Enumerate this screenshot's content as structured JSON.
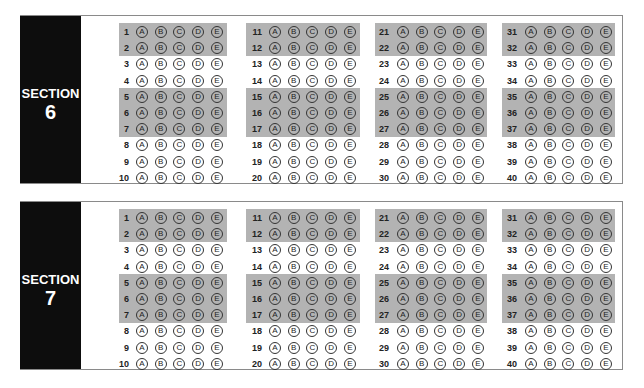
{
  "choices": [
    "A",
    "B",
    "C",
    "D",
    "E"
  ],
  "sections": [
    {
      "label": "SECTION",
      "number": "6",
      "columns": [
        {
          "questions": [
            "1",
            "2",
            "3",
            "4",
            "5",
            "6",
            "7",
            "8",
            "9",
            "10"
          ]
        },
        {
          "questions": [
            "11",
            "12",
            "13",
            "14",
            "15",
            "16",
            "17",
            "18",
            "19",
            "20"
          ]
        },
        {
          "questions": [
            "21",
            "22",
            "23",
            "24",
            "25",
            "26",
            "27",
            "28",
            "29",
            "30"
          ]
        },
        {
          "questions": [
            "31",
            "32",
            "33",
            "34",
            "35",
            "36",
            "37",
            "38",
            "39",
            "40"
          ]
        }
      ]
    },
    {
      "label": "SECTION",
      "number": "7",
      "columns": [
        {
          "questions": [
            "1",
            "2",
            "3",
            "4",
            "5",
            "6",
            "7",
            "8",
            "9",
            "10"
          ]
        },
        {
          "questions": [
            "11",
            "12",
            "13",
            "14",
            "15",
            "16",
            "17",
            "18",
            "19",
            "20"
          ]
        },
        {
          "questions": [
            "21",
            "22",
            "23",
            "24",
            "25",
            "26",
            "27",
            "28",
            "29",
            "30"
          ]
        },
        {
          "questions": [
            "31",
            "32",
            "33",
            "34",
            "35",
            "36",
            "37",
            "38",
            "39",
            "40"
          ]
        }
      ]
    }
  ],
  "shaded_row_groups": [
    [
      0,
      1
    ],
    [
      4,
      5,
      6
    ]
  ],
  "colors": {
    "label_bg": "#0d0d0d",
    "band": "#b3b3b3",
    "border": "#8a8a8a"
  }
}
